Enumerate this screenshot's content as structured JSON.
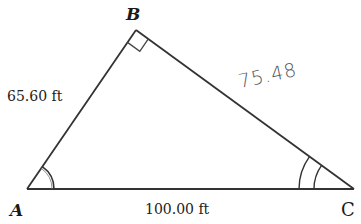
{
  "diagram": {
    "type": "right-triangle",
    "vertices": {
      "A": {
        "label": "A",
        "x": 27,
        "y": 189
      },
      "B": {
        "label": "B",
        "x": 136,
        "y": 30
      },
      "C": {
        "label": "C",
        "x": 354,
        "y": 189
      }
    },
    "sides": {
      "AB": {
        "label": "65.60 ft"
      },
      "AC": {
        "label": "100.00 ft"
      },
      "BC": {
        "label": "75.48",
        "handwritten": true
      }
    },
    "angle_marks": {
      "A": "single-arc",
      "B": "right-angle",
      "C": "double-arc"
    },
    "colors": {
      "line": "#333333",
      "text": "#1a1a1a",
      "handwriting": "#555555"
    }
  }
}
